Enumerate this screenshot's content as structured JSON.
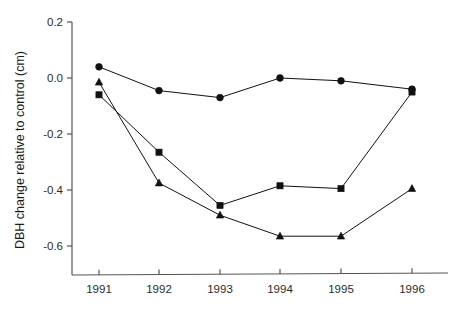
{
  "chart_data": {
    "type": "line",
    "title": "",
    "xlabel": "",
    "ylabel": "DBH change relative to control (cm)",
    "categories": [
      "1991",
      "1992",
      "1993",
      "1994",
      "1995",
      "1996"
    ],
    "x": [
      1991,
      1992,
      1993,
      1994,
      1995,
      1996
    ],
    "xlim": [
      1990.6,
      1996.4
    ],
    "ylim": [
      -0.7,
      0.2
    ],
    "yticks": [
      0.2,
      0.0,
      -0.2,
      -0.4,
      -0.6
    ],
    "ytick_labels": [
      "0.2",
      "0.0",
      "-0.2",
      "-0.4",
      "-0.6"
    ],
    "xtick_labels": [
      "1991",
      "1992",
      "1993",
      "1994",
      "1995",
      "1996"
    ],
    "grid": false,
    "legend": "none",
    "series": [
      {
        "name": "circle-series",
        "marker": "circle",
        "color": "#111111",
        "values": [
          0.04,
          -0.045,
          -0.07,
          0.0,
          -0.01,
          -0.04
        ]
      },
      {
        "name": "square-series",
        "marker": "square",
        "color": "#111111",
        "values": [
          -0.06,
          -0.265,
          -0.455,
          -0.385,
          -0.395,
          -0.05
        ]
      },
      {
        "name": "triangle-series",
        "marker": "triangle",
        "color": "#111111",
        "values": [
          -0.015,
          -0.375,
          -0.49,
          -0.565,
          -0.565,
          -0.395
        ]
      }
    ]
  },
  "axes": {
    "y_title": "DBH change relative to control (cm)"
  }
}
